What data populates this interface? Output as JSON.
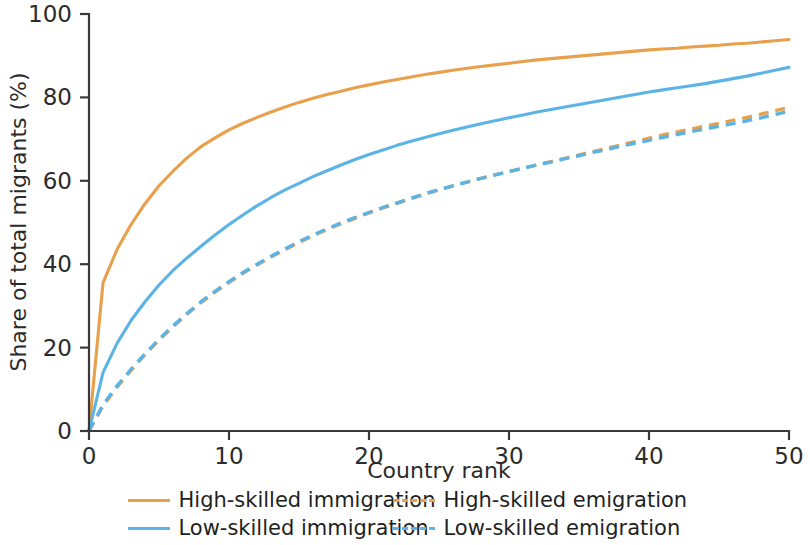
{
  "chart_data": {
    "type": "line",
    "title": "",
    "xlabel": "Country rank",
    "ylabel": "Share of total migrants (%)",
    "xlim": [
      0,
      50
    ],
    "ylim": [
      0,
      100
    ],
    "xticks": [
      0,
      10,
      20,
      30,
      40,
      50
    ],
    "yticks": [
      0,
      20,
      40,
      60,
      80,
      100
    ],
    "xtick_labels": [
      "0",
      "10",
      "20",
      "30",
      "40",
      "50"
    ],
    "ytick_labels": [
      "0",
      "20",
      "40",
      "60",
      "80",
      "100"
    ],
    "grid": false,
    "legend_position": "below",
    "x": [
      0,
      1,
      2,
      3,
      4,
      5,
      6,
      7,
      8,
      9,
      10,
      11,
      12,
      13,
      14,
      15,
      16,
      17,
      18,
      19,
      20,
      21,
      22,
      23,
      24,
      25,
      26,
      27,
      28,
      29,
      30,
      31,
      32,
      33,
      34,
      35,
      36,
      37,
      38,
      39,
      40,
      41,
      42,
      43,
      44,
      45,
      46,
      47,
      48,
      49,
      50
    ],
    "series": [
      {
        "name": "High-skilled immigration",
        "color": "#E8A04C",
        "style": "solid",
        "values": [
          0,
          35.5,
          43.5,
          49.5,
          54.5,
          58.8,
          62.3,
          65.5,
          68.2,
          70.3,
          72.2,
          73.8,
          75.2,
          76.5,
          77.7,
          78.8,
          79.8,
          80.7,
          81.5,
          82.3,
          83.0,
          83.7,
          84.3,
          84.9,
          85.5,
          86.0,
          86.5,
          87.0,
          87.4,
          87.8,
          88.2,
          88.6,
          89.0,
          89.3,
          89.6,
          89.9,
          90.2,
          90.5,
          90.8,
          91.1,
          91.4,
          91.6,
          91.8,
          92.1,
          92.3,
          92.5,
          92.8,
          93.0,
          93.3,
          93.6,
          93.9
        ]
      },
      {
        "name": "Low-skilled immigration",
        "color": "#5BB4E5",
        "style": "solid",
        "values": [
          0,
          14.0,
          21.0,
          26.5,
          31.0,
          35.0,
          38.5,
          41.5,
          44.3,
          47.0,
          49.5,
          51.8,
          54.0,
          56.0,
          57.8,
          59.4,
          61.0,
          62.4,
          63.8,
          65.1,
          66.3,
          67.4,
          68.5,
          69.5,
          70.4,
          71.3,
          72.1,
          72.9,
          73.7,
          74.4,
          75.1,
          75.8,
          76.5,
          77.1,
          77.7,
          78.3,
          78.9,
          79.5,
          80.1,
          80.7,
          81.3,
          81.8,
          82.3,
          82.8,
          83.3,
          83.9,
          84.5,
          85.1,
          85.8,
          86.5,
          87.2
        ]
      },
      {
        "name": "High-skilled emigration",
        "color": "#E8A04C",
        "style": "dashed",
        "values": [
          0,
          6.0,
          10.5,
          14.5,
          18.3,
          21.8,
          25.0,
          28.0,
          30.8,
          33.3,
          35.6,
          37.8,
          39.8,
          41.7,
          43.5,
          45.2,
          46.8,
          48.3,
          49.7,
          51.0,
          52.3,
          53.5,
          54.6,
          55.7,
          56.8,
          57.8,
          58.8,
          59.7,
          60.6,
          61.4,
          62.2,
          63.0,
          63.8,
          64.6,
          65.4,
          66.2,
          67.0,
          67.8,
          68.6,
          69.4,
          70.2,
          71.0,
          71.7,
          72.4,
          73.1,
          73.8,
          74.5,
          75.2,
          76.0,
          76.8,
          77.6
        ]
      },
      {
        "name": "Low-skilled emigration",
        "color": "#5BB4E5",
        "style": "dashed",
        "values": [
          0,
          6.3,
          10.8,
          14.8,
          18.5,
          22.0,
          25.2,
          28.2,
          31.0,
          33.5,
          35.8,
          38.0,
          40.0,
          41.9,
          43.7,
          45.4,
          47.0,
          48.5,
          49.9,
          51.2,
          52.4,
          53.6,
          54.7,
          55.8,
          56.9,
          57.9,
          58.8,
          59.7,
          60.6,
          61.4,
          62.2,
          63.0,
          63.8,
          64.5,
          65.3,
          66.0,
          66.8,
          67.5,
          68.3,
          69.0,
          69.7,
          70.4,
          71.1,
          71.8,
          72.4,
          73.1,
          73.7,
          74.4,
          75.1,
          75.9,
          76.7
        ]
      }
    ]
  },
  "legend": {
    "rows": [
      [
        {
          "label": "High-skilled immigration",
          "color": "#E8A04C",
          "style": "solid"
        },
        {
          "label": "High-skilled emigration",
          "color": "#E8A04C",
          "style": "dashed"
        }
      ],
      [
        {
          "label": "Low-skilled immigration",
          "color": "#5BB4E5",
          "style": "solid"
        },
        {
          "label": "Low-skilled emigration",
          "color": "#5BB4E5",
          "style": "dashed"
        }
      ]
    ]
  }
}
